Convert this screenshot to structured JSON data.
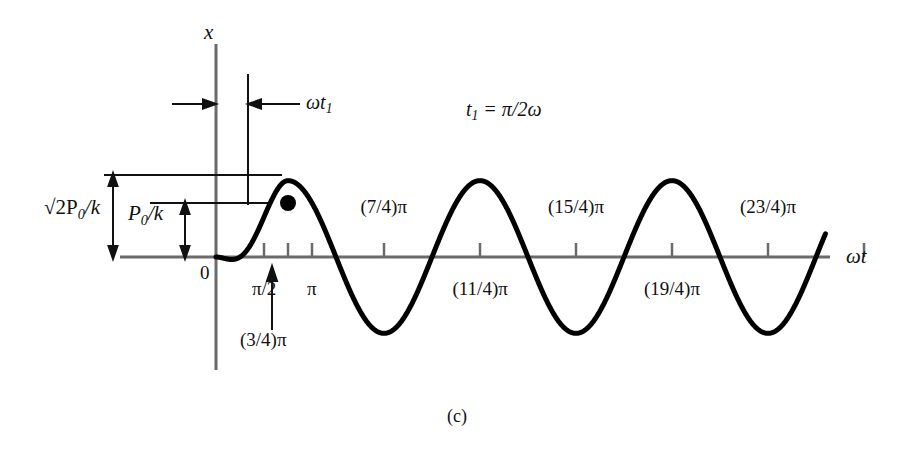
{
  "figure": {
    "caption": "(c)",
    "axes": {
      "y_label": "x",
      "x_label": "ωt",
      "origin_label": "0"
    },
    "annotations": {
      "dimension_wt1": "ωt",
      "dimension_wt1_sub": "1",
      "equation_lhs": "t",
      "equation_sub": "1",
      "equation_rhs": "= π/2ω",
      "amplitude_outer_prefix": "√2P",
      "amplitude_outer_sub": "0",
      "amplitude_outer_suffix": "/k",
      "amplitude_inner_prefix": "P",
      "amplitude_inner_sub": "0",
      "amplitude_inner_suffix": "/k",
      "marked_point_label": "(3/4)π"
    },
    "tick_labels_below": [
      "π/2",
      "π",
      "(11/4)π",
      "(19/4)π"
    ],
    "tick_labels_above": [
      "(7/4)π",
      "(15/4)π",
      "(23/4)π"
    ],
    "colors": {
      "curve": "#000000",
      "axis": "#6b6b6b",
      "annotation": "#111111",
      "background": "#ffffff"
    }
  },
  "chart_data": {
    "type": "line",
    "title": "",
    "xlabel": "ωt",
    "ylabel": "x",
    "xlim": [
      0,
      24.5
    ],
    "ylim": [
      -1.55,
      1.55
    ],
    "grid": false,
    "legend": false,
    "y_units": "P0/k",
    "amplitude_steady": 1.414,
    "amplitude_marked": 1.0,
    "phase_shift_pi": 0.75,
    "x_ticks_pi": [
      0.5,
      0.75,
      1,
      1.75,
      2.75,
      3.75,
      4.75,
      5.75,
      6.75
    ],
    "x_tick_label_map": {
      "0.5": "π/2",
      "1": "π",
      "1.75": "(7/4)π",
      "2.75": "(11/4)π",
      "3.75": "(15/4)π",
      "4.75": "(19/4)π",
      "5.75": "(23/4)π"
    },
    "marked_point": {
      "x_pi": 0.75,
      "y": 1.0,
      "label": "(3/4)π"
    },
    "series": [
      {
        "name": "x(ωt)",
        "comment": "Piecewise: smooth rise from origin blending into steady sine of amplitude √2 lagging by (3/4)π; terminates just past the final peak.",
        "x_start_pi": 0,
        "x_end_pi": 6.35,
        "steady_from_pi": 0.75
      }
    ]
  }
}
